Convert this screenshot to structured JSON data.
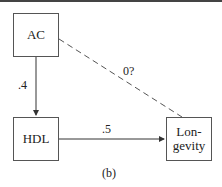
{
  "diagram": {
    "nodes": [
      {
        "id": "ac",
        "label": "AC"
      },
      {
        "id": "hdl",
        "label": "HDL"
      },
      {
        "id": "longevity",
        "label": "Lon-\ngevity"
      }
    ],
    "edges": [
      {
        "from": "ac",
        "to": "hdl",
        "label": ".4",
        "style": "solid"
      },
      {
        "from": "hdl",
        "to": "longevity",
        "label": ".5",
        "style": "solid"
      },
      {
        "from": "ac",
        "to": "longevity",
        "label": "0?",
        "style": "dashed"
      }
    ],
    "caption": "(b)"
  }
}
